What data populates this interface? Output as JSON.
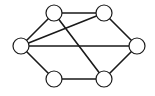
{
  "diagram": {
    "type": "undirected-graph",
    "node_radius": 8,
    "colors": {
      "stroke": "#1a1a1a",
      "node_fill": "#ffffff",
      "background": "#ffffff"
    },
    "nodes": [
      {
        "id": "left",
        "x": 21,
        "y": 46
      },
      {
        "id": "top-left",
        "x": 54,
        "y": 13
      },
      {
        "id": "top-right",
        "x": 104,
        "y": 13
      },
      {
        "id": "right",
        "x": 137,
        "y": 46
      },
      {
        "id": "bottom-left",
        "x": 54,
        "y": 79
      },
      {
        "id": "bottom-right",
        "x": 104,
        "y": 79
      }
    ],
    "edges": [
      {
        "from": "left",
        "to": "top-left"
      },
      {
        "from": "left",
        "to": "bottom-left"
      },
      {
        "from": "top-left",
        "to": "top-right"
      },
      {
        "from": "top-right",
        "to": "right"
      },
      {
        "from": "right",
        "to": "bottom-right"
      },
      {
        "from": "bottom-left",
        "to": "bottom-right"
      },
      {
        "from": "left",
        "to": "top-right"
      },
      {
        "from": "left",
        "to": "right"
      },
      {
        "from": "top-left",
        "to": "bottom-right"
      }
    ]
  }
}
